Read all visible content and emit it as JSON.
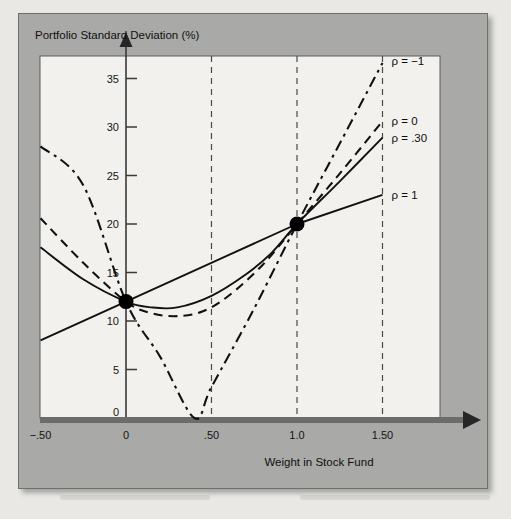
{
  "figure": {
    "panel_color": "#a9a9a7",
    "plot_background": "#f2f1ee",
    "axis_color": "#3a3a3a",
    "curve_color": "#111111",
    "marker_color": "#000000",
    "gridline_color": "#4a4a4a"
  },
  "chart_data": {
    "type": "line",
    "title": "",
    "ylabel": "Portfolio Standard Deviation (%)",
    "xlabel": "Weight in Stock Fund",
    "xlim": [
      -0.5,
      1.6
    ],
    "ylim": [
      0,
      38
    ],
    "grid": false,
    "x_ticks": [
      -0.5,
      0,
      0.5,
      1.0,
      1.5
    ],
    "x_tick_labels": [
      "−.50",
      "0",
      ".50",
      "1.0",
      "1.50"
    ],
    "y_ticks": [
      5,
      10,
      15,
      20,
      25,
      30,
      35
    ],
    "y_tick_labels": [
      "5",
      "10",
      "15",
      "20",
      "25",
      "30",
      "35"
    ],
    "origin_label": "0",
    "vertical_reference_lines": [
      0.5,
      1.0,
      1.5
    ],
    "legend_position": "right-inline",
    "markers": [
      {
        "x": 0,
        "y": 12,
        "label": ""
      },
      {
        "x": 1.0,
        "y": 20,
        "label": ""
      }
    ],
    "series": [
      {
        "name": "ρ = −1",
        "label": "ρ = −1",
        "style": "dash-dot",
        "label_y": 36.8,
        "points": [
          {
            "x": -0.5,
            "y": 28.0
          },
          {
            "x": -0.25,
            "y": 24.0
          },
          {
            "x": 0.0,
            "y": 12.0
          },
          {
            "x": 0.2,
            "y": 6.3
          },
          {
            "x": 0.4,
            "y": 0.0
          },
          {
            "x": 0.5,
            "y": 3.2
          },
          {
            "x": 0.75,
            "y": 11.3
          },
          {
            "x": 1.0,
            "y": 20.0
          },
          {
            "x": 1.25,
            "y": 28.3
          },
          {
            "x": 1.5,
            "y": 36.6
          }
        ]
      },
      {
        "name": "ρ = 0",
        "label": "ρ = 0",
        "style": "dashed",
        "label_y": 30.6,
        "points": [
          {
            "x": -0.5,
            "y": 20.6
          },
          {
            "x": -0.25,
            "y": 16.0
          },
          {
            "x": 0.0,
            "y": 12.0
          },
          {
            "x": 0.15,
            "y": 10.8
          },
          {
            "x": 0.3,
            "y": 10.5
          },
          {
            "x": 0.45,
            "y": 11.0
          },
          {
            "x": 0.6,
            "y": 12.6
          },
          {
            "x": 0.8,
            "y": 15.8
          },
          {
            "x": 1.0,
            "y": 20.0
          },
          {
            "x": 1.25,
            "y": 25.2
          },
          {
            "x": 1.5,
            "y": 30.6
          }
        ]
      },
      {
        "name": "ρ = .30",
        "label": "ρ = .30",
        "style": "solid",
        "label_y": 28.9,
        "points": [
          {
            "x": -0.5,
            "y": 17.6
          },
          {
            "x": -0.25,
            "y": 14.3
          },
          {
            "x": 0.0,
            "y": 12.0
          },
          {
            "x": 0.15,
            "y": 11.4
          },
          {
            "x": 0.3,
            "y": 11.4
          },
          {
            "x": 0.5,
            "y": 12.6
          },
          {
            "x": 0.7,
            "y": 14.8
          },
          {
            "x": 0.85,
            "y": 17.0
          },
          {
            "x": 1.0,
            "y": 20.0
          },
          {
            "x": 1.25,
            "y": 24.4
          },
          {
            "x": 1.5,
            "y": 28.9
          }
        ]
      },
      {
        "name": "ρ = 1",
        "label": "ρ = 1",
        "style": "solid",
        "label_y": 23.0,
        "points": [
          {
            "x": -0.5,
            "y": 8.0
          },
          {
            "x": 0.0,
            "y": 12.0
          },
          {
            "x": 1.0,
            "y": 20.0
          },
          {
            "x": 1.5,
            "y": 23.0
          }
        ]
      }
    ]
  }
}
